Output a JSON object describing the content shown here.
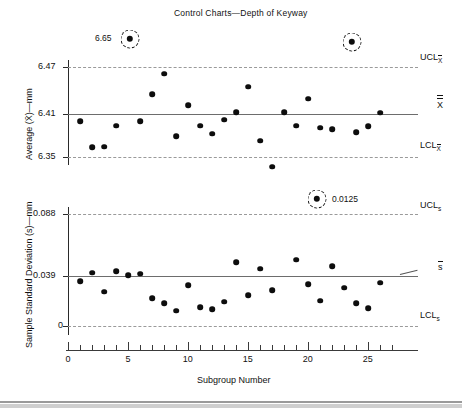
{
  "figure": {
    "title": "Control Charts—Depth of Keyway",
    "xlabel": "Subgroup Number"
  },
  "chart_data": [
    {
      "type": "scatter",
      "name": "xbar-chart",
      "title": "Control Charts—Depth of Keyway",
      "xlabel": "Subgroup Number",
      "ylabel": "Average (X̄) — mm",
      "ylim": [
        6.32,
        6.5
      ],
      "xlim": [
        0,
        27
      ],
      "yticks": [
        6.47,
        6.41,
        6.35
      ],
      "ytick_labels": [
        "6.47",
        "6.41",
        "6.35"
      ],
      "grid": false,
      "control_limits": {
        "ucl": 6.47,
        "center": 6.41,
        "lcl": 6.35,
        "ucl_label": "UCL",
        "ucl_sub": "X̄",
        "center_label": "X̄̄",
        "lcl_label": "LCL",
        "lcl_sub": "X̄"
      },
      "x": [
        1,
        2,
        3,
        4,
        5,
        6,
        7,
        8,
        9,
        10,
        11,
        12,
        13,
        14,
        15,
        16,
        17,
        18,
        19,
        20,
        21,
        22,
        23,
        24,
        25,
        26
      ],
      "y": [
        6.398,
        6.363,
        6.364,
        6.392,
        6.65,
        6.398,
        6.434,
        6.461,
        6.378,
        6.419,
        6.392,
        6.381,
        6.4,
        6.41,
        6.444,
        6.372,
        6.337,
        6.41,
        6.392,
        6.428,
        6.389,
        6.387,
        6.52,
        6.383,
        6.391,
        6.409
      ],
      "out_of_control": [
        {
          "subgroup": 5,
          "value": 6.65,
          "label": "6.65",
          "position": "above-ucl"
        },
        {
          "subgroup": 23,
          "value": 6.52,
          "label": "",
          "position": "above-ucl"
        }
      ]
    },
    {
      "type": "scatter",
      "name": "s-chart",
      "title": "",
      "xlabel": "Subgroup Number",
      "ylabel": "Sample Standard Deviation (s) — mm",
      "ylim": [
        -0.004,
        0.098
      ],
      "xlim": [
        0,
        27
      ],
      "yticks": [
        0.088,
        0.039,
        0
      ],
      "ytick_labels": [
        "0.088",
        "0.039",
        "0"
      ],
      "grid": false,
      "control_limits": {
        "ucl": 0.088,
        "center": 0.039,
        "lcl": 0.0,
        "ucl_label": "UCL",
        "ucl_sub": "s",
        "center_label": "s̄",
        "lcl_label": "LCL",
        "lcl_sub": "s"
      },
      "x": [
        1,
        2,
        3,
        4,
        5,
        6,
        7,
        8,
        9,
        10,
        11,
        12,
        13,
        14,
        15,
        16,
        17,
        18,
        19,
        20,
        21,
        22,
        23,
        24,
        25,
        26
      ],
      "y": [
        0.035,
        0.042,
        0.027,
        0.043,
        0.04,
        0.041,
        0.022,
        0.018,
        0.012,
        0.032,
        0.015,
        0.013,
        0.019,
        0.05,
        0.024,
        0.045,
        0.028,
        0.0125,
        0.052,
        0.033,
        0.02,
        0.047,
        0.03,
        0.018,
        0.014,
        0.034
      ],
      "out_of_control": [
        {
          "subgroup": 18,
          "value": 0.0125,
          "label": "0.0125",
          "position": "above-ucl"
        }
      ]
    }
  ],
  "xaxis": {
    "major_ticks": [
      0,
      5,
      10,
      15,
      20,
      25
    ],
    "major_labels": [
      "0",
      "5",
      "10",
      "15",
      "20",
      "25"
    ],
    "minor_ticks": [
      1,
      2,
      3,
      4,
      6,
      7,
      8,
      9,
      11,
      12,
      13,
      14,
      16,
      17,
      18,
      19,
      21,
      22,
      23,
      24,
      26,
      27
    ]
  },
  "top_chart": {
    "ylabel_avg": "Average (",
    "ylabel_xbar": "X",
    "ylabel_tail": ")—mm",
    "ylabel_full": "Average (X̄)—mm",
    "ytick_hi": "6.47",
    "ytick_mid": "6.41",
    "ytick_lo": "6.35",
    "ucl_text": "UCL",
    "ucl_sub": "X",
    "center_text": "X",
    "lcl_text": "LCL",
    "lcl_sub": "X",
    "annotation": "6.65"
  },
  "bottom_chart": {
    "ylabel_full": "Sample Standard Deviation (s)—mm",
    "ytick_hi": "0.088",
    "ytick_mid": "0.039",
    "ytick_lo": "0",
    "ucl_text": "UCL",
    "ucl_sub": "s",
    "center_text": "s",
    "lcl_text": "LCL",
    "lcl_sub": "s",
    "annotation": "0.0125"
  },
  "colors": {
    "point": "#0d0d0d",
    "centerline": "#6d6d6d",
    "limitline": "#9a9a9a",
    "axis": "#2a2a2a",
    "text": "#111111"
  }
}
